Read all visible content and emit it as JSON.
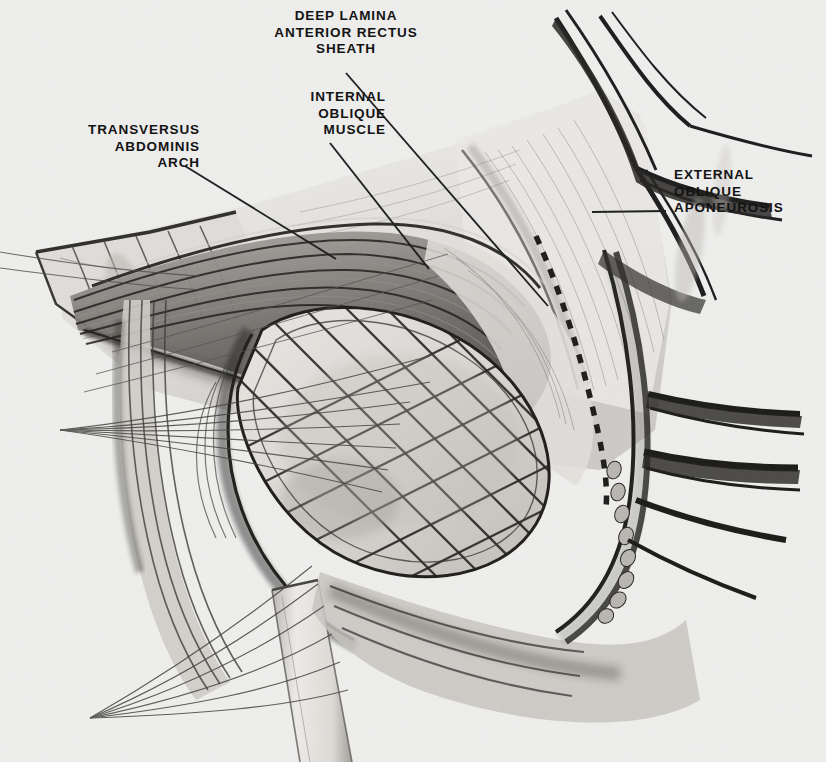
{
  "figure": {
    "kind": "anatomical-illustration",
    "background_color": "#ededec",
    "ink_color": "#151515",
    "width": 826,
    "height": 762
  },
  "labels": {
    "deep_lamina": {
      "text": "DEEP LAMINA\nANTERIOR RECTUS\nSHEATH",
      "align": "center",
      "leader": {
        "from": [
          346,
          73
        ],
        "to": [
          548,
          306
        ]
      }
    },
    "internal_oblique": {
      "text": "INTERNAL\nOBLIQUE\nMUSCLE",
      "align": "right",
      "leader": {
        "from": [
          330,
          143
        ],
        "to": [
          429,
          269
        ]
      }
    },
    "transversus": {
      "text": "TRANSVERSUS\nABDOMINIS\nARCH",
      "align": "right",
      "leader": {
        "from": [
          185,
          166
        ],
        "to": [
          336,
          259
        ]
      }
    },
    "external_oblique": {
      "text": "EXTERNAL\nOBLIQUE\nAPONEUROSIS",
      "align": "left",
      "leader": {
        "from": [
          666,
          211
        ],
        "to": [
          592,
          212
        ]
      }
    }
  },
  "structures": [
    {
      "name": "external-oblique-flap",
      "note": "large pale aponeurotic sheet retracted to upper right"
    },
    {
      "name": "internal-oblique-muscle",
      "note": "striated fibrous band sweeping across upper middle"
    },
    {
      "name": "transversus-abdominis-arch",
      "note": "arching fibres at the left of the field"
    },
    {
      "name": "deep-lamina-rectus-sheath",
      "note": "smooth lamina beneath the aponeurotic flap"
    },
    {
      "name": "cross-hatched-mesh",
      "note": "oval prosthetic/suture lattice in the centre of the field"
    },
    {
      "name": "dashed-suture-line",
      "note": "running dotted suture along the right border of the flap"
    },
    {
      "name": "retraction-sutures-upper",
      "note": "fan of threads converging left at approx (60,430)"
    },
    {
      "name": "retraction-sutures-lower",
      "note": "fan of threads converging left at approx (90,718)"
    },
    {
      "name": "spermatic-cord-band",
      "note": "pale vertical band descending at bottom centre"
    },
    {
      "name": "retracted-tissue-strands",
      "note": "dark forked strands at top right corner"
    },
    {
      "name": "inguinal-ligament-edge",
      "note": "thick dark curved margin at lower right"
    }
  ]
}
